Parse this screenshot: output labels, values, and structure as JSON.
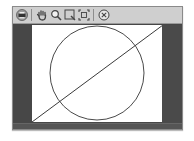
{
  "window": {
    "toolbar": {
      "buttons": [
        {
          "name": "print",
          "icon": "printer-icon"
        },
        {
          "name": "pan",
          "icon": "hand-icon"
        },
        {
          "name": "zoom",
          "icon": "magnifier-icon"
        },
        {
          "name": "zoom-box",
          "icon": "zoom-rect-icon"
        },
        {
          "name": "fit",
          "icon": "fit-extent-icon"
        },
        {
          "name": "close",
          "icon": "close-circle-icon"
        }
      ]
    },
    "canvas": {
      "background": "#ffffff",
      "frame_color": "#474747",
      "shapes": [
        {
          "type": "circle",
          "cx": 65,
          "cy": 48,
          "r": 47,
          "stroke": "#4a4a4a"
        },
        {
          "type": "line",
          "x1": 0,
          "y1": 97,
          "x2": 131,
          "y2": 0,
          "stroke": "#3a3a3a"
        }
      ]
    }
  }
}
